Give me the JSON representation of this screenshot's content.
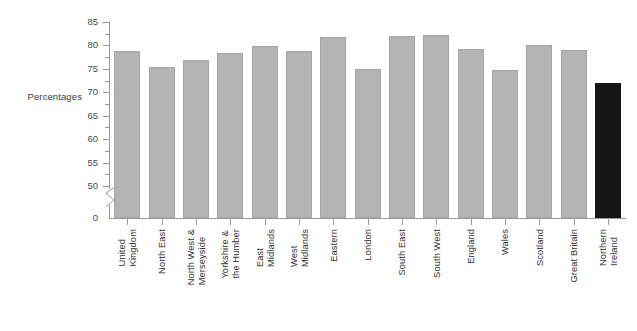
{
  "chart_data": {
    "type": "bar",
    "title": "",
    "subtitle": "",
    "xlabel": "",
    "ylabel": "Percentages",
    "ylim": [
      50,
      85
    ],
    "y_axis_break": true,
    "y_axis_zero_label": "0",
    "yticks": [
      50,
      55,
      60,
      65,
      70,
      75,
      80,
      85
    ],
    "ytick_labels": [
      "50",
      "55",
      "60",
      "65",
      "70",
      "75",
      "80",
      "85"
    ],
    "grid": false,
    "legend": "none",
    "categories": [
      "United Kingdom",
      "North East",
      "North West & Merseyside",
      "Yorkshire & the Humber",
      "East Midlands",
      "West Midlands",
      "Eastern",
      "London",
      "South East",
      "South West",
      "England",
      "Wales",
      "Scotland",
      "Great Britain",
      "Northern Ireland"
    ],
    "category_lines": [
      [
        "United",
        "Kingdom"
      ],
      [
        "North East"
      ],
      [
        "North West &",
        "Merseyside"
      ],
      [
        "Yorkshire &",
        "the Humber"
      ],
      [
        "East",
        "Midlands"
      ],
      [
        "West",
        "Midlands"
      ],
      [
        "Eastern"
      ],
      [
        "London"
      ],
      [
        "South East"
      ],
      [
        "South West"
      ],
      [
        "England"
      ],
      [
        "Wales"
      ],
      [
        "Scotland"
      ],
      [
        "Great Britain"
      ],
      [
        "Northern",
        "Ireland"
      ]
    ],
    "values": [
      78.8,
      75.3,
      77.0,
      78.3,
      79.8,
      78.8,
      81.8,
      75.0,
      82.0,
      82.3,
      79.2,
      74.8,
      80.2,
      79.0,
      72.0
    ],
    "bar_colors": [
      "#b4b4b4",
      "#b4b4b4",
      "#b4b4b4",
      "#b4b4b4",
      "#b4b4b4",
      "#b4b4b4",
      "#b4b4b4",
      "#b4b4b4",
      "#b4b4b4",
      "#b4b4b4",
      "#b4b4b4",
      "#b4b4b4",
      "#b4b4b4",
      "#b4b4b4",
      "#141414"
    ],
    "highlight_category": "Northern Ireland",
    "colors": {
      "bar_default": "#b4b4b4",
      "bar_highlight": "#141414",
      "axis": "#9a9a9a",
      "text": "#2f2f2f",
      "background": "#ffffff"
    }
  }
}
